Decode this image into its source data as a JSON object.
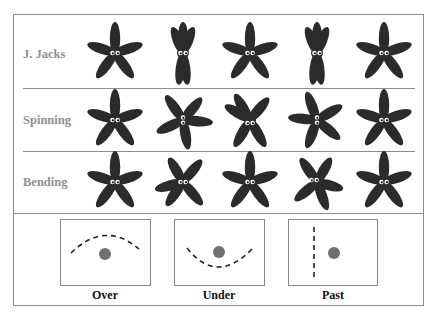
{
  "rows": [
    {
      "label": "J. Jacks",
      "poses": [
        "star",
        "jack",
        "star",
        "jack",
        "star"
      ]
    },
    {
      "label": "Spinning",
      "poses": [
        "star",
        "rot1",
        "rot2",
        "rot3",
        "star"
      ]
    },
    {
      "label": "Bending",
      "poses": [
        "star",
        "bend1",
        "star",
        "bend2",
        "star"
      ]
    }
  ],
  "motions": [
    {
      "label": "Over",
      "path": "over"
    },
    {
      "label": "Under",
      "path": "under"
    },
    {
      "label": "Past",
      "path": "past"
    }
  ],
  "colors": {
    "starfish": "#2b2b2b",
    "dot": "#6f6f6f",
    "label_gray": "#8f8f8f",
    "border": "#8c8c8c"
  }
}
